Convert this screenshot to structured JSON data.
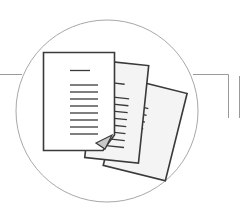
{
  "illustration": {
    "title": "Documents",
    "description": "Stack of three paper documents inside a circle with connector lines",
    "icon": "documents-stack-icon",
    "colors": {
      "stroke": "#3a3a3a",
      "circle": "#a8a8a8",
      "connector": "#9a9a9a",
      "page_fill": "#ffffff",
      "back_page_fill": "#f4f4f4",
      "fold_fill": "#c8c8c8",
      "background": "#ffffff"
    },
    "pages": 3
  }
}
